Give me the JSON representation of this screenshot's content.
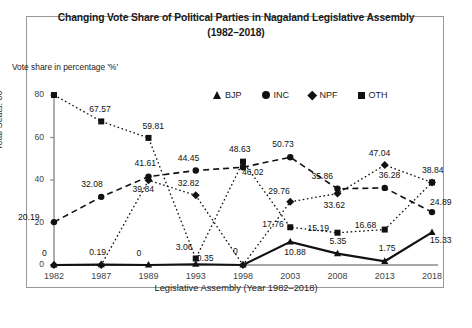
{
  "chart_data": {
    "type": "line",
    "title": "Changing Vote Share of Political Parties in Nagaland Legislative Assembly (1982–2018)",
    "title_line1": "Changing Vote Share of Political Parties in Nagaland Legislative Assembly",
    "title_line2": "(1982–2018)",
    "subtitle": "Vote share in percentage '%'",
    "xlabel": "Legislative Assembly (Year 1982–2018)",
    "ylabel": "Total Seats: 60",
    "categories": [
      "1982",
      "1987",
      "1989",
      "1993",
      "1998",
      "2003",
      "2008",
      "2013",
      "2018"
    ],
    "ylim": [
      0,
      80
    ],
    "yticks": [
      "0",
      "20",
      "40",
      "60",
      "80"
    ],
    "grid": false,
    "legend_position": "top-right",
    "series": [
      {
        "name": "BJP",
        "marker": "triangle",
        "line": "solid",
        "values": [
          0,
          0.19,
          0,
          0.35,
          0,
          10.88,
          5.35,
          1.75,
          15.33
        ],
        "labels": [
          "0",
          "0.19",
          "0",
          "0.35",
          "0",
          "10.88",
          "5.35",
          "1.75",
          "15.33"
        ]
      },
      {
        "name": "INC",
        "marker": "circle",
        "line": "dashed",
        "values": [
          20.19,
          32.08,
          41.61,
          44.45,
          46.02,
          50.73,
          35.86,
          36.28,
          24.89
        ],
        "labels": [
          "20.19",
          "32.08",
          "41.61",
          "44.45",
          "46.02",
          "50.73",
          "35.86",
          "36.28",
          "24.89"
        ]
      },
      {
        "name": "NPF",
        "marker": "diamond",
        "line": "dotted",
        "values": [
          0,
          0,
          39.84,
          32.82,
          0,
          29.76,
          33.62,
          47.04,
          38.84
        ],
        "labels": [
          "",
          "",
          "39.84",
          "32.82",
          "",
          "29.76",
          "33.62",
          "47.04",
          "38.84"
        ]
      },
      {
        "name": "OTH",
        "marker": "square",
        "line": "dotted",
        "values": [
          80,
          67.57,
          59.81,
          3.06,
          48.63,
          17.76,
          15.19,
          16.68,
          38.84
        ],
        "labels": [
          "",
          "67.57",
          "59.81",
          "3.06",
          "48.63",
          "17.76",
          "15.19",
          "16.68",
          ""
        ]
      }
    ]
  },
  "legend": {
    "items": [
      {
        "label": "BJP",
        "marker": "triangle"
      },
      {
        "label": "INC",
        "marker": "circle"
      },
      {
        "label": "NPF",
        "marker": "diamond"
      },
      {
        "label": "OTH",
        "marker": "square"
      }
    ]
  },
  "colors": {
    "ink": "#111111",
    "axis": "#8a8a8a",
    "border": "#9a9a9a"
  }
}
